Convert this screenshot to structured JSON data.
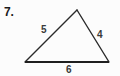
{
  "figure": {
    "problem_number": "7.",
    "shape": "triangle",
    "background_color": "#fcfcfc",
    "stroke_color": "#2a2a2a",
    "base_stroke_color": "#1f1f1f",
    "label_color": "#3a3a3a",
    "vertices": {
      "apex": {
        "x": 77,
        "y": 10
      },
      "left": {
        "x": 25,
        "y": 62
      },
      "right": {
        "x": 109,
        "y": 62
      }
    },
    "sides": [
      {
        "name": "left-side",
        "label": "5",
        "from": "left",
        "to": "apex"
      },
      {
        "name": "right-side",
        "label": "4",
        "from": "apex",
        "to": "right"
      },
      {
        "name": "base",
        "label": "6",
        "from": "left",
        "to": "right"
      }
    ],
    "labels": {
      "left_side": "5",
      "right_side": "4",
      "base": "6"
    }
  }
}
